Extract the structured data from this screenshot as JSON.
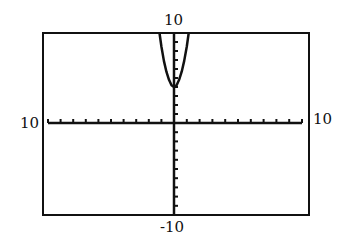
{
  "window": {
    "labels": {
      "ymax": "10",
      "ymin": "-10",
      "xmin": "10",
      "xmax": "10"
    }
  },
  "chart_data": {
    "type": "line",
    "title": "",
    "xlabel": "",
    "ylabel": "",
    "xlim": [
      -10,
      10
    ],
    "ylim": [
      -10,
      10
    ],
    "xscale_ticks": 1,
    "yscale_ticks": 1,
    "grid": false,
    "axis_labels_shown": {
      "top": "10",
      "bottom": "-10",
      "left": "10",
      "right": "10"
    },
    "series": [
      {
        "name": "parabola",
        "description": "Steep upward-opening parabola, vertex near (0, 4)",
        "x": [
          -1.15,
          -1.0,
          -0.8,
          -0.6,
          -0.4,
          -0.2,
          0,
          0.2,
          0.4,
          0.6,
          0.8,
          1.0,
          1.15
        ],
        "values": [
          10.0,
          8.5,
          6.9,
          5.7,
          4.8,
          4.2,
          4.0,
          4.2,
          4.8,
          5.7,
          6.9,
          8.5,
          10.0
        ]
      }
    ],
    "colors": {
      "line": "#111111",
      "frame": "#111111",
      "background": "#ffffff"
    }
  }
}
